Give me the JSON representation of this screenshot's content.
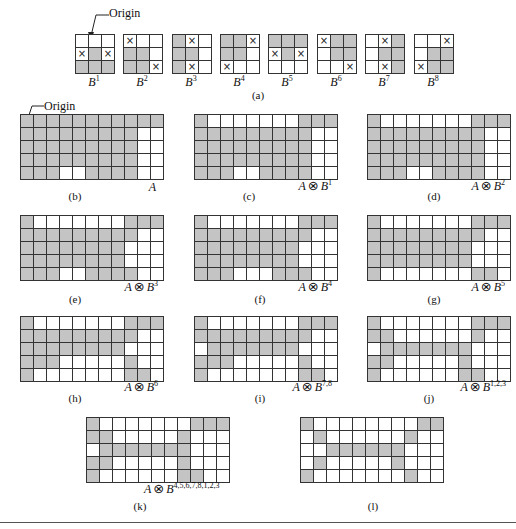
{
  "figure": {
    "origin_label": "Origin",
    "panel_a_caption": "(a)",
    "kernels": [
      {
        "id": "B1",
        "base": "B",
        "sup": "1",
        "cells": [
          "000",
          "x1x",
          "111"
        ]
      },
      {
        "id": "B2",
        "base": "B",
        "sup": "2",
        "cells": [
          "x00",
          "110",
          "11x"
        ]
      },
      {
        "id": "B3",
        "base": "B",
        "sup": "3",
        "cells": [
          "1x0",
          "110",
          "1x0"
        ]
      },
      {
        "id": "B4",
        "base": "B",
        "sup": "4",
        "cells": [
          "11x",
          "110",
          "x00"
        ]
      },
      {
        "id": "B5",
        "base": "B",
        "sup": "5",
        "cells": [
          "111",
          "x1x",
          "000"
        ]
      },
      {
        "id": "B6",
        "base": "B",
        "sup": "6",
        "cells": [
          "x11",
          "011",
          "00x"
        ]
      },
      {
        "id": "B7",
        "base": "B",
        "sup": "7",
        "cells": [
          "0x1",
          "011",
          "0x1"
        ]
      },
      {
        "id": "B8",
        "base": "B",
        "sup": "8",
        "cells": [
          "00x",
          "011",
          "x11"
        ]
      }
    ],
    "grids": [
      {
        "id": "b",
        "caption": "(b)",
        "label_base": "A",
        "label_op": "",
        "label_sup": "",
        "rows": [
          "11111111111",
          "11111111100",
          "11111111100",
          "11111111100",
          "11100111100"
        ]
      },
      {
        "id": "c",
        "caption": "(c)",
        "label_base": "A",
        "label_op": "⊗",
        "label_b": "B",
        "label_sup": "1",
        "rows": [
          "10000000111",
          "11111111100",
          "11111111100",
          "11111111100",
          "11100111100"
        ]
      },
      {
        "id": "d",
        "caption": "(d)",
        "label_base": "A",
        "label_op": "⊗",
        "label_b": "B",
        "label_sup": "2",
        "rows": [
          "10000000111",
          "11111111100",
          "11111111100",
          "11111111100",
          "11100111100"
        ]
      },
      {
        "id": "e",
        "caption": "(e)",
        "label_base": "A",
        "label_op": "⊗",
        "label_b": "B",
        "label_sup": "3",
        "rows": [
          "10000000111",
          "11111111100",
          "11111111000",
          "11111111000",
          "11100111100"
        ]
      },
      {
        "id": "f",
        "caption": "(f)",
        "label_base": "A",
        "label_op": "⊗",
        "label_b": "B",
        "label_sup": "4",
        "rows": [
          "10000000111",
          "11111111100",
          "11111111000",
          "11111111000",
          "11100011100"
        ]
      },
      {
        "id": "g",
        "caption": "(g)",
        "label_base": "A",
        "label_op": "⊗",
        "label_b": "B",
        "label_sup": "5",
        "rows": [
          "10000000111",
          "11111111100",
          "11111111000",
          "11111111000",
          "10000000110"
        ]
      },
      {
        "id": "h",
        "caption": "(h)",
        "label_base": "A",
        "label_op": "⊗",
        "label_b": "B",
        "label_sup": "6",
        "rows": [
          "10000000111",
          "11111111100",
          "11111111000",
          "11100000100",
          "10000000110"
        ]
      },
      {
        "id": "i",
        "caption": "(i)",
        "label_base": "A",
        "label_op": "⊗",
        "label_b": "B",
        "label_sup": "7,8",
        "rows": [
          "10000000111",
          "11111111100",
          "01111111000",
          "11100000100",
          "10000000110"
        ]
      },
      {
        "id": "j",
        "caption": "(j)",
        "label_base": "A",
        "label_op": "⊗",
        "label_b": "B",
        "label_sup": "1,2,3",
        "rows": [
          "10000000111",
          "11000000100",
          "01111111000",
          "11000001000",
          "10000001100"
        ]
      },
      {
        "id": "k",
        "caption": "(k)",
        "label_base": "A",
        "label_op": "⊗",
        "label_b": "B",
        "label_sup": "4,5,6,7,8,1,2,3",
        "rows": [
          "10000000111",
          "11000001000",
          "01111111000",
          "11000001000",
          "10000001100"
        ]
      },
      {
        "id": "l",
        "caption": "(l)",
        "label_base": "",
        "label_op": "",
        "label_sup": "",
        "rows": [
          "10000000011",
          "01000000100",
          "00111111000",
          "01000001000",
          "10000000100"
        ]
      }
    ],
    "colors": {
      "shaded": "#c4c4c4",
      "lines": "#333333",
      "background": "#ffffff"
    }
  }
}
